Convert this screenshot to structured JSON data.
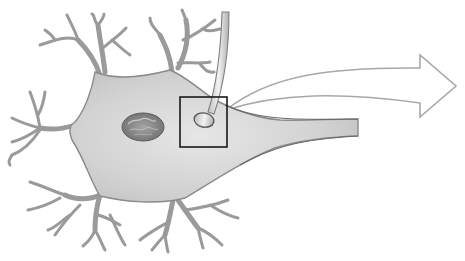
{
  "diagram": {
    "parts": [
      {
        "id": "cell-body",
        "label": ""
      },
      {
        "id": "nucleus",
        "label": ""
      },
      {
        "id": "dendrites",
        "label": ""
      },
      {
        "id": "axon",
        "label": ""
      },
      {
        "id": "presynaptic-axon-terminal",
        "label": ""
      },
      {
        "id": "synapse-highlight-box",
        "label": ""
      },
      {
        "id": "magnify-arrow",
        "label": ""
      }
    ],
    "colors": {
      "background": "#ffffff",
      "cell_fill": "#d6d6d6",
      "cell_fill_light": "#e8e8e8",
      "cell_outline": "#8a8a8a",
      "nucleus_fill": "#8f8f8f",
      "nucleus_dark": "#5e5e5e",
      "box_stroke": "#1a1a1a",
      "arrow_stroke": "#a8a8a8",
      "arrow_fill": "#ffffff"
    },
    "highlight_box": {
      "x": 180,
      "y": 97,
      "w": 47,
      "h": 50
    }
  }
}
